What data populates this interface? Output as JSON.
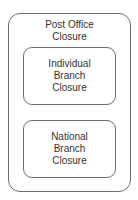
{
  "diagram": {
    "outer": {
      "label": "Post Office\nClosure"
    },
    "children": [
      {
        "label": "Individual\nBranch\nClosure"
      },
      {
        "label": "National\nBranch\nClosure"
      }
    ],
    "colors": {
      "border": "#6e6e6e",
      "text": "#333333",
      "background": "#ffffff"
    }
  }
}
